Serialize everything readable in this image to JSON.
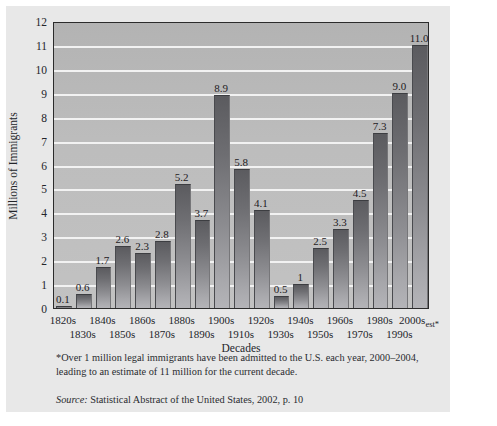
{
  "chart_data": {
    "type": "bar",
    "title": "",
    "xlabel": "Decades",
    "ylabel": "Millions of Immigrants",
    "ylim": [
      0,
      12
    ],
    "ytick_labels": [
      "0",
      "1",
      "2",
      "3",
      "4",
      "5",
      "6",
      "7",
      "8",
      "9",
      "10",
      "11",
      "12"
    ],
    "grid": true,
    "legend": "none",
    "categories": [
      "1820s",
      "1830s",
      "1840s",
      "1850s",
      "1860s",
      "1870s",
      "1880s",
      "1890s",
      "1900s",
      "1910s",
      "1920s",
      "1930s",
      "1940s",
      "1950s",
      "1960s",
      "1970s",
      "1980s",
      "1990s",
      "2000s"
    ],
    "category_suffixes": {
      "2000s": "est*"
    },
    "values": [
      0.1,
      0.6,
      1.7,
      2.6,
      2.3,
      2.8,
      5.2,
      3.7,
      8.9,
      5.8,
      4.1,
      0.5,
      1,
      2.5,
      3.3,
      4.5,
      7.3,
      9.0,
      11.0
    ],
    "value_labels": [
      "0.1",
      "0.6",
      "1.7",
      "2.6",
      "2.3",
      "2.8",
      "5.2",
      "3.7",
      "8.9",
      "5.8",
      "4.1",
      "0.5",
      "1",
      "2.5",
      "3.3",
      "4.5",
      "7.3",
      "9.0",
      "11.0"
    ]
  },
  "notes": {
    "footnote": "*Over 1 million legal immigrants have been admitted to the U.S. each year, 2000–2004, leading to an estimate of 11 million for the current decade.",
    "source_word": "Source:",
    "source_text": " Statistical Abstract of the United States, 2002, p. 10"
  },
  "colors": {
    "figure_background": "#e8e8e8",
    "plot_background": "#bdbdbd",
    "gridline": "#f2f2f2",
    "bar_top": "#5b5b5f",
    "bar_bottom": "#b4b4b8",
    "axis_border": "#2b2b2b",
    "text": "#23252a"
  }
}
